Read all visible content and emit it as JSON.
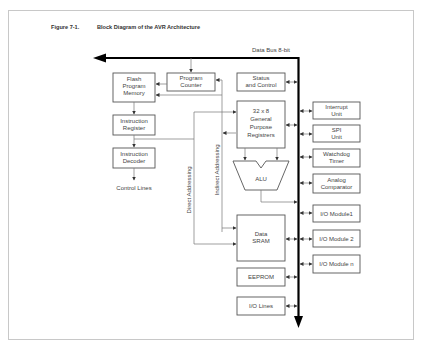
{
  "figure": {
    "number": "Figure 7-1.",
    "title": "Block Diagram of the AVR Architecture"
  },
  "bus": {
    "label": "Data Bus 8-bit"
  },
  "blocks": {
    "flash": [
      "Flash",
      "Program",
      "Memory"
    ],
    "program_counter": [
      "Program",
      "Counter"
    ],
    "status_control": [
      "Status",
      "and Control"
    ],
    "instruction_register": [
      "Instruction",
      "Register"
    ],
    "instruction_decoder": [
      "Instruction",
      "Decoder"
    ],
    "control_lines": "Control Lines",
    "gpr": [
      "32 x 8",
      "General",
      "Purpose",
      "Registrers"
    ],
    "alu": "ALU",
    "data_sram": [
      "Data",
      "SRAM"
    ],
    "eeprom": "EEPROM",
    "io_lines": "I/O Lines"
  },
  "peripherals": [
    {
      "lines": [
        "Interrupt",
        "Unit"
      ]
    },
    {
      "lines": [
        "SPI",
        "Unit"
      ]
    },
    {
      "lines": [
        "Watchdog",
        "Timer"
      ]
    },
    {
      "lines": [
        "Analog",
        "Comparator"
      ]
    },
    {
      "lines": [
        "I/O Module1"
      ]
    },
    {
      "lines": [
        "I/O Module 2"
      ]
    },
    {
      "lines": [
        "I/O Module n"
      ]
    }
  ],
  "addressing": {
    "direct": "Direct Addressing",
    "indirect": "Indirect Addressing"
  }
}
